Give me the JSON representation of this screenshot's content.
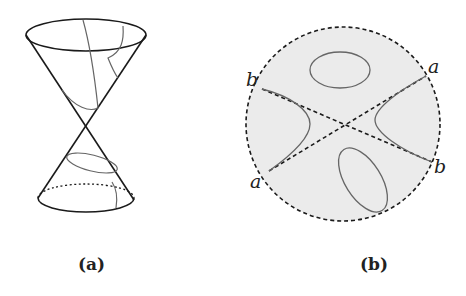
{
  "figure": {
    "panels": [
      {
        "id": "a",
        "caption": "(a)",
        "description": "Double cone with conic section curves (hyperbola, ellipse, parabola)"
      },
      {
        "id": "b",
        "caption": "(b)",
        "description": "Disk with dashed boundary showing asymptote lines a-a and b-b, hyperbola branches and ellipses",
        "labels": {
          "b_left": "b",
          "a_right": "a",
          "a_left": "a",
          "b_right": "b"
        }
      }
    ]
  },
  "colors": {
    "stroke": "#1a1a1a",
    "curve": "#666666",
    "disk_fill": "#ebebeb"
  }
}
